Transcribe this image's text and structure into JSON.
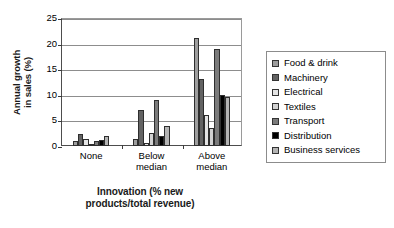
{
  "chart_data": {
    "type": "bar",
    "title": "",
    "xlabel": "Innovation (% new products/total revenue)",
    "ylabel": "Annual growth in sales (%)",
    "categories": [
      "None",
      "Below median",
      "Above median"
    ],
    "ylim": [
      0,
      25
    ],
    "yticks": [
      0,
      5,
      10,
      15,
      20,
      25
    ],
    "grid": true,
    "legend_position": "right",
    "series": [
      {
        "name": "Food & drink",
        "color": "#9d9d9d",
        "values": [
          1.0,
          1.4,
          21.0
        ]
      },
      {
        "name": "Machinery",
        "color": "#636363",
        "values": [
          2.4,
          7.0,
          13.0
        ]
      },
      {
        "name": "Electrical",
        "color": "#e4e4e4",
        "values": [
          1.3,
          0.6,
          6.0
        ]
      },
      {
        "name": "Textiles",
        "color": "#d2d2d2",
        "values": [
          0.3,
          2.5,
          3.6
        ]
      },
      {
        "name": "Transport",
        "color": "#7b7b7b",
        "values": [
          0.9,
          9.0,
          19.0
        ]
      },
      {
        "name": "Distribution",
        "color": "#000000",
        "values": [
          1.2,
          2.0,
          10.0
        ]
      },
      {
        "name": "Business services",
        "color": "#b4b4b4",
        "values": [
          2.0,
          4.0,
          9.5
        ]
      }
    ]
  },
  "axes": {
    "ytitle_line1": "Annual growth",
    "ytitle_line2": "in sales (%)",
    "xtitle_line1": "Innovation (% new",
    "xtitle_line2": "products/total revenue)",
    "ytick_labels": [
      "25",
      "20",
      "15",
      "10",
      "5",
      "0"
    ],
    "xtick_labels": [
      "None",
      "Below\nmedian",
      "Above\nmedian"
    ]
  },
  "legend": {
    "items": [
      {
        "label": "Food & drink",
        "color": "#9d9d9d"
      },
      {
        "label": "Machinery",
        "color": "#636363"
      },
      {
        "label": "Electrical",
        "color": "#e4e4e4"
      },
      {
        "label": "Textiles",
        "color": "#d2d2d2"
      },
      {
        "label": "Transport",
        "color": "#7b7b7b"
      },
      {
        "label": "Distribution",
        "color": "#000000"
      },
      {
        "label": "Business services",
        "color": "#b4b4b4"
      }
    ]
  }
}
